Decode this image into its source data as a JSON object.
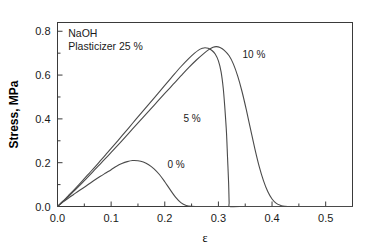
{
  "chart_data": {
    "type": "line",
    "title": "",
    "annotations": [
      {
        "name": "material",
        "text": "NaOH",
        "x": 0.02,
        "y": 0.775
      },
      {
        "name": "plasticizer",
        "text": "Plasticizer 25 %",
        "x": 0.02,
        "y": 0.715
      }
    ],
    "xlabel": "ε",
    "ylabel": "Stress, MPa",
    "xlim": [
      0.0,
      0.55
    ],
    "ylim": [
      0.0,
      0.84
    ],
    "grid": false,
    "legend_position": "inline-curve-labels",
    "x_ticks_major": [
      "0.0",
      "0.1",
      "0.2",
      "0.3",
      "0.4",
      "0.5"
    ],
    "x_tick_values": [
      0.0,
      0.1,
      0.2,
      0.3,
      0.4,
      0.5
    ],
    "x_minor_tick_values": [
      0.05,
      0.15,
      0.25,
      0.35,
      0.45
    ],
    "y_ticks_major": [
      "0.0",
      "0.2",
      "0.4",
      "0.6",
      "0.8"
    ],
    "y_tick_values": [
      0.0,
      0.2,
      0.4,
      0.6,
      0.8
    ],
    "y_minor_tick_values": [
      0.1,
      0.3,
      0.5,
      0.7
    ],
    "series": [
      {
        "name": "0 %",
        "label": "0 %",
        "label_x": 0.205,
        "label_y": 0.175,
        "peak_strain": 0.14,
        "peak_stress": 0.21,
        "break_strain": 0.24,
        "points": [
          [
            0.0,
            0.0
          ],
          [
            0.01,
            0.02
          ],
          [
            0.02,
            0.038
          ],
          [
            0.03,
            0.055
          ],
          [
            0.04,
            0.072
          ],
          [
            0.05,
            0.088
          ],
          [
            0.06,
            0.105
          ],
          [
            0.07,
            0.122
          ],
          [
            0.08,
            0.138
          ],
          [
            0.09,
            0.153
          ],
          [
            0.1,
            0.168
          ],
          [
            0.11,
            0.184
          ],
          [
            0.12,
            0.196
          ],
          [
            0.13,
            0.205
          ],
          [
            0.14,
            0.21
          ],
          [
            0.15,
            0.209
          ],
          [
            0.16,
            0.203
          ],
          [
            0.17,
            0.191
          ],
          [
            0.18,
            0.172
          ],
          [
            0.19,
            0.146
          ],
          [
            0.2,
            0.113
          ],
          [
            0.21,
            0.077
          ],
          [
            0.22,
            0.043
          ],
          [
            0.23,
            0.018
          ],
          [
            0.24,
            0.005
          ],
          [
            0.25,
            0.001
          ],
          [
            0.27,
            0.0
          ],
          [
            0.32,
            0.0
          ],
          [
            0.4,
            0.0
          ],
          [
            0.5,
            0.0
          ],
          [
            0.55,
            0.0
          ]
        ]
      },
      {
        "name": "5 %",
        "label": "5 %",
        "label_x": 0.235,
        "label_y": 0.385,
        "peak_strain": 0.275,
        "peak_stress": 0.725,
        "break_strain": 0.32,
        "points": [
          [
            0.0,
            0.0
          ],
          [
            0.01,
            0.024
          ],
          [
            0.02,
            0.049
          ],
          [
            0.03,
            0.074
          ],
          [
            0.04,
            0.1
          ],
          [
            0.05,
            0.127
          ],
          [
            0.06,
            0.154
          ],
          [
            0.07,
            0.181
          ],
          [
            0.08,
            0.209
          ],
          [
            0.09,
            0.237
          ],
          [
            0.1,
            0.265
          ],
          [
            0.12,
            0.322
          ],
          [
            0.14,
            0.38
          ],
          [
            0.16,
            0.438
          ],
          [
            0.18,
            0.495
          ],
          [
            0.2,
            0.553
          ],
          [
            0.215,
            0.596
          ],
          [
            0.23,
            0.638
          ],
          [
            0.245,
            0.676
          ],
          [
            0.255,
            0.699
          ],
          [
            0.263,
            0.714
          ],
          [
            0.27,
            0.722
          ],
          [
            0.275,
            0.725
          ],
          [
            0.281,
            0.722
          ],
          [
            0.288,
            0.712
          ],
          [
            0.294,
            0.696
          ],
          [
            0.3,
            0.665
          ],
          [
            0.305,
            0.615
          ],
          [
            0.309,
            0.54
          ],
          [
            0.312,
            0.45
          ],
          [
            0.315,
            0.34
          ],
          [
            0.317,
            0.225
          ],
          [
            0.319,
            0.11
          ],
          [
            0.32,
            0.02
          ],
          [
            0.321,
            0.0
          ],
          [
            0.34,
            0.0
          ],
          [
            0.4,
            0.0
          ],
          [
            0.5,
            0.0
          ],
          [
            0.55,
            0.0
          ]
        ]
      },
      {
        "name": "10 %",
        "label": "10 %",
        "label_x": 0.345,
        "label_y": 0.68,
        "peak_strain": 0.295,
        "peak_stress": 0.73,
        "break_strain": 0.41,
        "points": [
          [
            0.0,
            0.0
          ],
          [
            0.01,
            0.022
          ],
          [
            0.02,
            0.045
          ],
          [
            0.03,
            0.069
          ],
          [
            0.04,
            0.093
          ],
          [
            0.05,
            0.118
          ],
          [
            0.06,
            0.143
          ],
          [
            0.07,
            0.169
          ],
          [
            0.08,
            0.195
          ],
          [
            0.09,
            0.221
          ],
          [
            0.1,
            0.247
          ],
          [
            0.12,
            0.3
          ],
          [
            0.14,
            0.354
          ],
          [
            0.16,
            0.408
          ],
          [
            0.18,
            0.462
          ],
          [
            0.2,
            0.516
          ],
          [
            0.215,
            0.556
          ],
          [
            0.23,
            0.596
          ],
          [
            0.245,
            0.635
          ],
          [
            0.26,
            0.671
          ],
          [
            0.272,
            0.697
          ],
          [
            0.282,
            0.716
          ],
          [
            0.29,
            0.727
          ],
          [
            0.296,
            0.73
          ],
          [
            0.303,
            0.726
          ],
          [
            0.311,
            0.713
          ],
          [
            0.32,
            0.688
          ],
          [
            0.328,
            0.65
          ],
          [
            0.336,
            0.595
          ],
          [
            0.344,
            0.525
          ],
          [
            0.352,
            0.442
          ],
          [
            0.36,
            0.352
          ],
          [
            0.368,
            0.263
          ],
          [
            0.376,
            0.183
          ],
          [
            0.384,
            0.118
          ],
          [
            0.392,
            0.068
          ],
          [
            0.4,
            0.034
          ],
          [
            0.408,
            0.014
          ],
          [
            0.416,
            0.005
          ],
          [
            0.424,
            0.001
          ],
          [
            0.44,
            0.0
          ],
          [
            0.48,
            0.0
          ],
          [
            0.52,
            0.0
          ],
          [
            0.55,
            0.0
          ]
        ]
      }
    ]
  }
}
